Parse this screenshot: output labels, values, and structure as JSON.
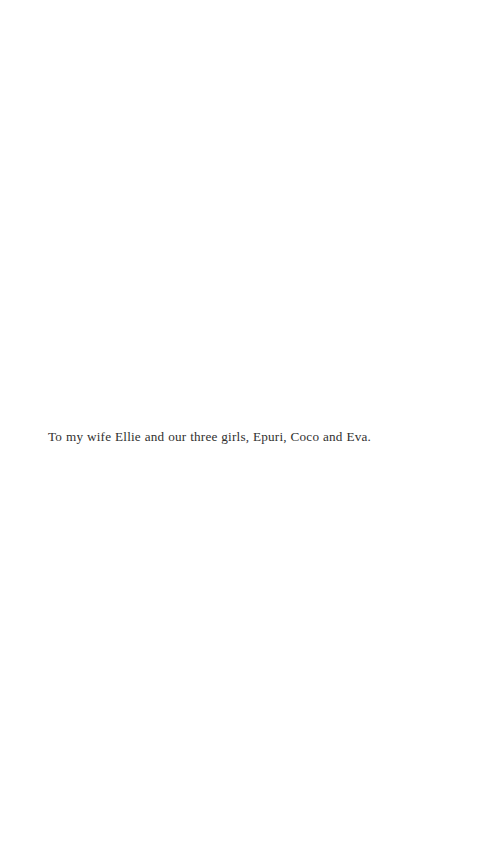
{
  "page": {
    "type": "book-dedication-page",
    "background_color": "#ffffff",
    "text_color": "#30302f",
    "width": 483,
    "height": 864
  },
  "dedication": {
    "text": "To my wife Ellie and our three girls, Epuri, Coco and Eva."
  }
}
